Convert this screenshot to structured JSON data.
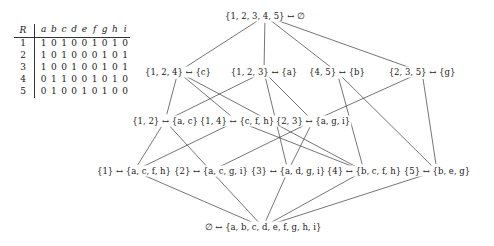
{
  "context": {
    "object_header": "R",
    "attribute_headers": [
      "a",
      "b",
      "c",
      "d",
      "e",
      "f",
      "g",
      "h",
      "i"
    ],
    "rows": [
      {
        "object": "1",
        "bits": [
          "1",
          "0",
          "1",
          "0",
          "0",
          "1",
          "0",
          "1",
          "0"
        ]
      },
      {
        "object": "2",
        "bits": [
          "1",
          "0",
          "1",
          "0",
          "0",
          "0",
          "1",
          "0",
          "1"
        ]
      },
      {
        "object": "3",
        "bits": [
          "1",
          "0",
          "0",
          "1",
          "0",
          "0",
          "1",
          "0",
          "1"
        ]
      },
      {
        "object": "4",
        "bits": [
          "0",
          "1",
          "1",
          "0",
          "0",
          "1",
          "0",
          "1",
          "0"
        ]
      },
      {
        "object": "5",
        "bits": [
          "0",
          "1",
          "0",
          "0",
          "1",
          "0",
          "1",
          "0",
          "0"
        ]
      }
    ]
  },
  "lattice": {
    "nodes": [
      {
        "id": "top",
        "label": "{1, 2, 3, 4, 5} ↔ ∅",
        "x": 265,
        "y": 16
      },
      {
        "id": "l2a",
        "label": "{1, 2, 4} ↔ {c}",
        "x": 178,
        "y": 72
      },
      {
        "id": "l2b",
        "label": "{1, 2, 3} ↔ {a}",
        "x": 264,
        "y": 72
      },
      {
        "id": "l2c",
        "label": "{4, 5} ↔ {b}",
        "x": 337,
        "y": 72
      },
      {
        "id": "l2d",
        "label": "{2, 3, 5} ↔ {g}",
        "x": 422,
        "y": 72
      },
      {
        "id": "l3a",
        "label": "{1, 2} ↔ {a, c}",
        "x": 165,
        "y": 121
      },
      {
        "id": "l3b",
        "label": "{1, 4} ↔ {c, f, h}",
        "x": 237,
        "y": 121
      },
      {
        "id": "l3c",
        "label": "{2, 3} ↔ {a, g, i}",
        "x": 313,
        "y": 121
      },
      {
        "id": "l4a",
        "label": "{1} ↔ {a, c, f, h}",
        "x": 134,
        "y": 171
      },
      {
        "id": "l4b",
        "label": "{2} ↔ {a, c, g, i}",
        "x": 211,
        "y": 171
      },
      {
        "id": "l4c",
        "label": "{3} ↔ {a, d, g, i}",
        "x": 288,
        "y": 171
      },
      {
        "id": "l4d",
        "label": "{4} ↔ {b, c, f, h}",
        "x": 364,
        "y": 171
      },
      {
        "id": "l4e",
        "label": "{5} ↔ {b, e, g}",
        "x": 437,
        "y": 171
      },
      {
        "id": "bot",
        "label": "∅ ↔ {a, b, c, d, e, f, g, h, i}",
        "x": 263,
        "y": 227
      }
    ],
    "edges": [
      [
        "top",
        "l2a"
      ],
      [
        "top",
        "l2b"
      ],
      [
        "top",
        "l2c"
      ],
      [
        "top",
        "l2d"
      ],
      [
        "l2a",
        "l3a"
      ],
      [
        "l2a",
        "l3b"
      ],
      [
        "l2a",
        "l4d"
      ],
      [
        "l2b",
        "l3a"
      ],
      [
        "l2b",
        "l3c"
      ],
      [
        "l2b",
        "l4c"
      ],
      [
        "l2c",
        "l4d"
      ],
      [
        "l2c",
        "l4e"
      ],
      [
        "l2d",
        "l3c"
      ],
      [
        "l2d",
        "l4e"
      ],
      [
        "l3a",
        "l4a"
      ],
      [
        "l3a",
        "l4b"
      ],
      [
        "l3b",
        "l4a"
      ],
      [
        "l3b",
        "l4d"
      ],
      [
        "l3c",
        "l4b"
      ],
      [
        "l3c",
        "l4c"
      ],
      [
        "l4a",
        "bot"
      ],
      [
        "l4b",
        "bot"
      ],
      [
        "l4c",
        "bot"
      ],
      [
        "l4d",
        "bot"
      ],
      [
        "l4e",
        "bot"
      ]
    ],
    "line_color": "#3a3a3a"
  }
}
